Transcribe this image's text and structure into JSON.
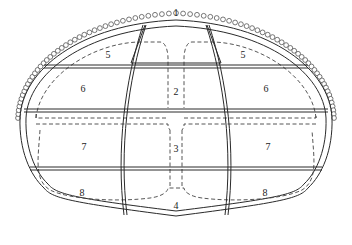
{
  "diagram": {
    "type": "tunnel-cross-section-excavation-sequence",
    "colors": {
      "line": "#2a2a2a",
      "dashed": "#444444",
      "bead": "#555555",
      "background": "#ffffff"
    },
    "sections": [
      {
        "id": "1",
        "label": "1",
        "x": 176,
        "y": 14
      },
      {
        "id": "5L",
        "label": "5",
        "x": 108,
        "y": 56
      },
      {
        "id": "5R",
        "label": "5",
        "x": 243,
        "y": 56
      },
      {
        "id": "2",
        "label": "2",
        "x": 176,
        "y": 93
      },
      {
        "id": "6L",
        "label": "6",
        "x": 83,
        "y": 90
      },
      {
        "id": "6R",
        "label": "6",
        "x": 266,
        "y": 90
      },
      {
        "id": "7L",
        "label": "7",
        "x": 84,
        "y": 148
      },
      {
        "id": "3",
        "label": "3",
        "x": 176,
        "y": 150
      },
      {
        "id": "7R",
        "label": "7",
        "x": 268,
        "y": 148
      },
      {
        "id": "8L",
        "label": "8",
        "x": 82,
        "y": 194
      },
      {
        "id": "4",
        "label": "4",
        "x": 176,
        "y": 207
      },
      {
        "id": "8R",
        "label": "8",
        "x": 265,
        "y": 194
      }
    ]
  }
}
